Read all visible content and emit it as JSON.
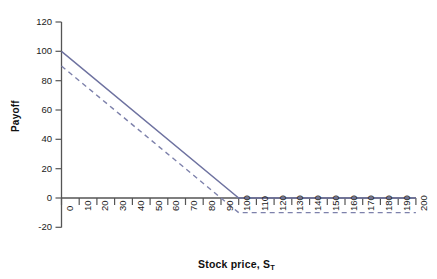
{
  "chart_data": {
    "type": "line",
    "title": "",
    "xlabel": "Stock price, S",
    "xlabel_sub": "T",
    "ylabel": "Payoff",
    "xlim": [
      0,
      200
    ],
    "ylim": [
      -20,
      120
    ],
    "xticks": [
      0,
      10,
      20,
      30,
      40,
      50,
      60,
      70,
      80,
      90,
      100,
      110,
      120,
      130,
      140,
      150,
      160,
      170,
      180,
      190,
      200
    ],
    "yticks": [
      -20,
      0,
      20,
      40,
      60,
      80,
      100,
      120
    ],
    "grid": false,
    "legend": "none",
    "line_color": "#6e72a0",
    "axis_color": "#555555",
    "series": [
      {
        "name": "payoff-solid",
        "style": "solid",
        "color": "#6e72a0",
        "x": [
          0,
          100,
          200
        ],
        "y": [
          100,
          0,
          0
        ]
      },
      {
        "name": "payoff-dashed",
        "style": "dashed",
        "color": "#7d81ab",
        "x": [
          0,
          100,
          200
        ],
        "y": [
          90,
          -10,
          -10
        ]
      }
    ]
  }
}
